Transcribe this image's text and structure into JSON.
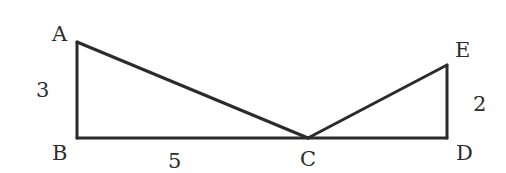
{
  "diagram": {
    "type": "geometry",
    "points": {
      "A": {
        "label": "A",
        "x": 77,
        "y": 42
      },
      "B": {
        "label": "B",
        "x": 77,
        "y": 138
      },
      "C": {
        "label": "C",
        "x": 308,
        "y": 138
      },
      "D": {
        "label": "D",
        "x": 447,
        "y": 138
      },
      "E": {
        "label": "E",
        "x": 447,
        "y": 65
      }
    },
    "segments": [
      [
        "A",
        "B"
      ],
      [
        "B",
        "C"
      ],
      [
        "A",
        "C"
      ],
      [
        "C",
        "D"
      ],
      [
        "D",
        "E"
      ],
      [
        "C",
        "E"
      ]
    ],
    "measurements": {
      "AB": "3",
      "BC": "5",
      "DE": "2"
    },
    "colors": {
      "stroke": "#2b2b2b",
      "background": "#ffffff"
    }
  }
}
